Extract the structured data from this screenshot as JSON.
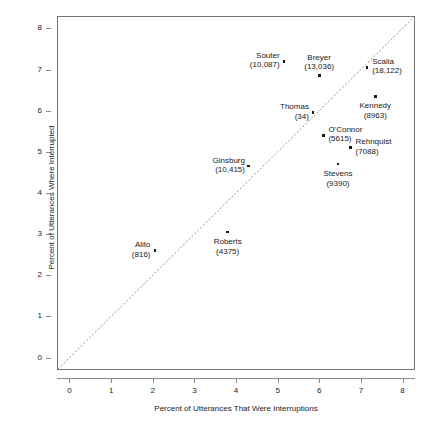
{
  "chart_data": {
    "type": "scatter",
    "title": "",
    "xlabel": "Percent of Utterances That Were Interruptions",
    "ylabel": "Percent of Utterances Where Interrupted",
    "xlim": [
      -0.3,
      8.3
    ],
    "ylim": [
      -0.3,
      8.3
    ],
    "xticks": [
      0,
      1,
      2,
      3,
      4,
      5,
      6,
      7,
      8
    ],
    "yticks": [
      0,
      1,
      2,
      3,
      4,
      5,
      6,
      7,
      8
    ],
    "xticklabels": [
      "0",
      "1",
      "2",
      "3",
      "4",
      "5",
      "6",
      "7",
      "8"
    ],
    "yticklabels": [
      "0",
      "1",
      "2",
      "3",
      "4",
      "5",
      "6",
      "7",
      "8"
    ],
    "grid": false,
    "legend": false,
    "reference_line": {
      "kind": "identity",
      "label": "y = x",
      "style": "dotted",
      "color": "#909090"
    },
    "points": [
      {
        "name": "Souter",
        "count": "10,087",
        "label_line1": "Souter",
        "label_line2": "(10,087)",
        "x": 5.15,
        "y": 7.2,
        "label_pos": "left"
      },
      {
        "name": "Breyer",
        "count": "13,036",
        "label_line1": "Breyer",
        "label_line2": "(13,036)",
        "x": 6.0,
        "y": 6.85,
        "label_pos": "above"
      },
      {
        "name": "Scalia",
        "count": "18,122",
        "label_line1": "Scalia",
        "label_line2": "(18,122)",
        "x": 7.15,
        "y": 7.05,
        "label_pos": "right"
      },
      {
        "name": "Kennedy",
        "count": "8963",
        "label_line1": "Kennedy",
        "label_line2": "(8963)",
        "x": 7.35,
        "y": 6.35,
        "label_pos": "below"
      },
      {
        "name": "Thomas",
        "count": "34",
        "label_line1": "Thomas",
        "label_line2": "(34)",
        "x": 5.85,
        "y": 5.95,
        "label_pos": "left"
      },
      {
        "name": "O'Connor",
        "count": "5615",
        "label_line1": "O'Connor",
        "label_line2": "(5615)",
        "x": 6.1,
        "y": 5.4,
        "label_pos": "right"
      },
      {
        "name": "Rehnquist",
        "count": "7088",
        "label_line1": "Rehnquist",
        "label_line2": "(7088)",
        "x": 6.75,
        "y": 5.1,
        "label_pos": "right"
      },
      {
        "name": "Stevens",
        "count": "9390",
        "label_line1": "Stevens",
        "label_line2": "(9390)",
        "x": 6.45,
        "y": 4.7,
        "label_pos": "below"
      },
      {
        "name": "Ginsburg",
        "count": "10,415",
        "label_line1": "Ginsburg",
        "label_line2": "(10,415)",
        "x": 4.3,
        "y": 4.65,
        "label_pos": "left"
      },
      {
        "name": "Roberts",
        "count": "4375",
        "label_line1": "Roberts",
        "label_line2": "(4375)",
        "x": 3.8,
        "y": 3.05,
        "label_pos": "below"
      },
      {
        "name": "Alito",
        "count": "816",
        "label_line1": "Alito",
        "label_line2": "(816)",
        "x": 2.05,
        "y": 2.6,
        "label_pos": "left"
      }
    ]
  }
}
